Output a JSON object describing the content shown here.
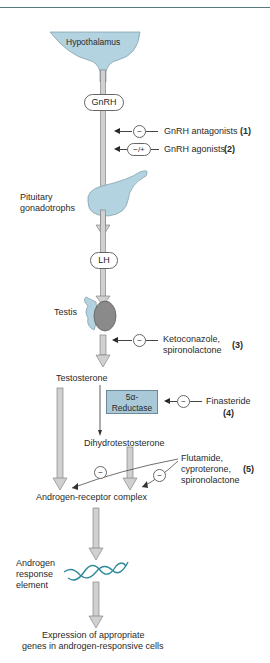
{
  "colors": {
    "organ_fill": "#b3d3e0",
    "enzyme_fill": "#a9c9d8",
    "testis_fill": "#8a8a8a",
    "dna": "#2e8a9a",
    "arrow_fill": "#d0d0d0"
  },
  "nodes": {
    "hypothalamus": "Hypothalamus",
    "gnrh": "GnRH",
    "pituitary": [
      "Pituitary",
      "gonadotrophs"
    ],
    "lh": "LH",
    "testis": "Testis",
    "testosterone": "Testosterone",
    "reductase": [
      "5α-",
      "Reductase"
    ],
    "dht": "Dihydrotestosterone",
    "arc": "Androgen-receptor complex",
    "are": [
      "Androgen",
      "response",
      "element"
    ],
    "expression": [
      "Expression of appropriate",
      "genes in androgen-responsive cells"
    ]
  },
  "drugs": [
    {
      "label": "GnRH antagonists",
      "num": "(1)",
      "sign": "−"
    },
    {
      "label": "GnRH agonists",
      "num": "(2)",
      "sign": "−/+"
    },
    {
      "label": [
        "Ketoconazole,",
        "spironolactone"
      ],
      "num": "(3)",
      "sign": "−"
    },
    {
      "label": "Finasteride",
      "num": "(4)",
      "sign": "−"
    },
    {
      "label": [
        "Flutamide,",
        "cyproterone,",
        "spironolactone"
      ],
      "num": "(5)",
      "sign": "−"
    }
  ]
}
